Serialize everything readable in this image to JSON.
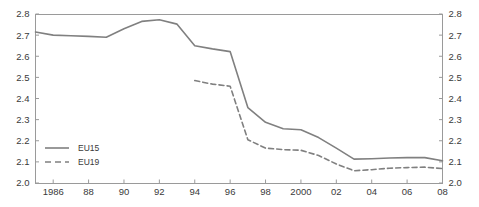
{
  "chart_data": {
    "type": "line",
    "title": "",
    "subtitle": "",
    "xlabel": "",
    "ylabel": "",
    "xlim": [
      1985,
      2008
    ],
    "ylim": [
      2.0,
      2.8
    ],
    "grid": false,
    "legend_position": "bottom-left",
    "y_ticks": [
      "2.0",
      "2.1",
      "2.2",
      "2.3",
      "2.4",
      "2.5",
      "2.6",
      "2.7",
      "2.8"
    ],
    "y_tick_values": [
      2.0,
      2.1,
      2.2,
      2.3,
      2.4,
      2.5,
      2.6,
      2.7,
      2.8
    ],
    "y_axis_right_ticks": [
      "2.0",
      "2.1",
      "2.2",
      "2.3",
      "2.4",
      "2.5",
      "2.6",
      "2.7",
      "2.8"
    ],
    "x_ticks": [
      "1986",
      "88",
      "90",
      "92",
      "94",
      "96",
      "98",
      "2000",
      "02",
      "04",
      "06",
      "08"
    ],
    "x_tick_values": [
      1986,
      1988,
      1990,
      1992,
      1994,
      1996,
      1998,
      2000,
      2002,
      2004,
      2006,
      2008
    ],
    "x": [
      1985,
      1986,
      1987,
      1988,
      1989,
      1990,
      1991,
      1992,
      1993,
      1994,
      1995,
      1996,
      1997,
      1998,
      1999,
      2000,
      2001,
      2002,
      2003,
      2004,
      2005,
      2006,
      2007,
      2008
    ],
    "series": [
      {
        "name": "EU15",
        "style": "solid",
        "color": "#808080",
        "x": [
          1985,
          1986,
          1987,
          1988,
          1989,
          1990,
          1991,
          1992,
          1993,
          1994,
          1995,
          1996,
          1997,
          1998,
          1999,
          2000,
          2001,
          2002,
          2003,
          2004,
          2005,
          2006,
          2007,
          2008
        ],
        "values": [
          2.715,
          2.7,
          2.697,
          2.694,
          2.69,
          2.73,
          2.765,
          2.773,
          2.752,
          2.65,
          2.635,
          2.622,
          2.357,
          2.287,
          2.257,
          2.252,
          2.215,
          2.165,
          2.113,
          2.115,
          2.118,
          2.12,
          2.12,
          2.105
        ]
      },
      {
        "name": "EU19",
        "style": "dashed",
        "color": "#808080",
        "x": [
          1994,
          1995,
          1996,
          1997,
          1998,
          1999,
          2000,
          2001,
          2002,
          2003,
          2004,
          2005,
          2006,
          2007,
          2008
        ],
        "values": [
          2.485,
          2.468,
          2.458,
          2.205,
          2.165,
          2.158,
          2.155,
          2.13,
          2.09,
          2.058,
          2.063,
          2.07,
          2.073,
          2.075,
          2.068
        ]
      }
    ],
    "legend": [
      {
        "label": "EU15",
        "style": "solid"
      },
      {
        "label": "EU19",
        "style": "dashed"
      }
    ]
  },
  "colors": {
    "line": "#808080",
    "axis": "#808080",
    "text": "#3a3a3a",
    "background": "#ffffff"
  }
}
